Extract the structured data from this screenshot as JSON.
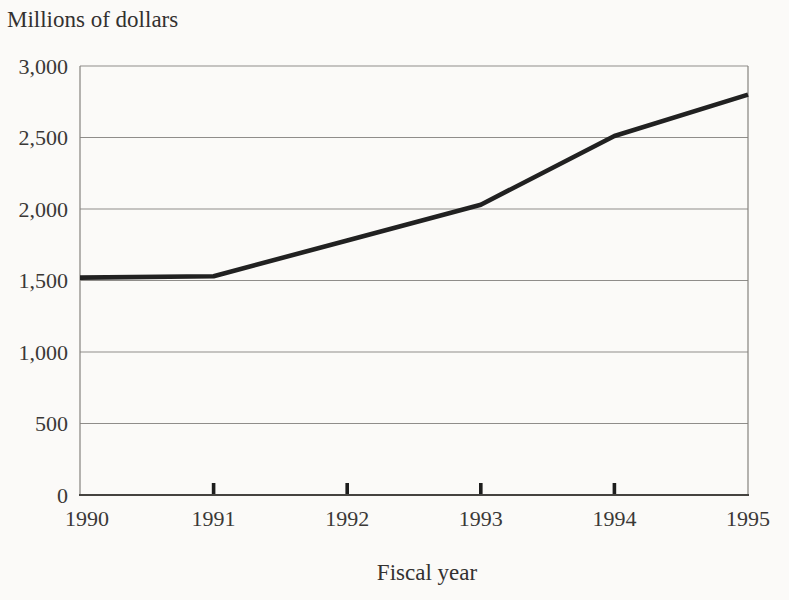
{
  "chart": {
    "unit_label": "Millions of dollars",
    "x_axis_title": "Fiscal year"
  },
  "chart_data": {
    "type": "line",
    "title": "Millions of dollars",
    "xlabel": "Fiscal year",
    "ylabel": "Millions of dollars",
    "x": [
      1990,
      1991,
      1992,
      1993,
      1994,
      1995
    ],
    "x_tick_labels": [
      "1990",
      "1991",
      "1992",
      "1993",
      "1994",
      "1995"
    ],
    "series": [
      {
        "name": "Dollars in millions",
        "values": [
          1520,
          1530,
          1780,
          2030,
          2510,
          2800
        ]
      }
    ],
    "ylim": [
      0,
      3000
    ],
    "y_ticks": [
      0,
      500,
      1000,
      1500,
      2000,
      2500,
      3000
    ],
    "y_tick_labels": [
      "0",
      "500",
      "1,000",
      "1,500",
      "2,000",
      "2,500",
      "3,000"
    ],
    "grid": "horizontal",
    "legend_position": "none",
    "colors": {
      "background": "#fbfaf8",
      "line": "#212121",
      "gridline": "#8f8d8a",
      "plot_border": "#85827e",
      "bottom_axis": "#454340",
      "tick_mark": "#1d1d1d",
      "text": "#333130"
    }
  }
}
